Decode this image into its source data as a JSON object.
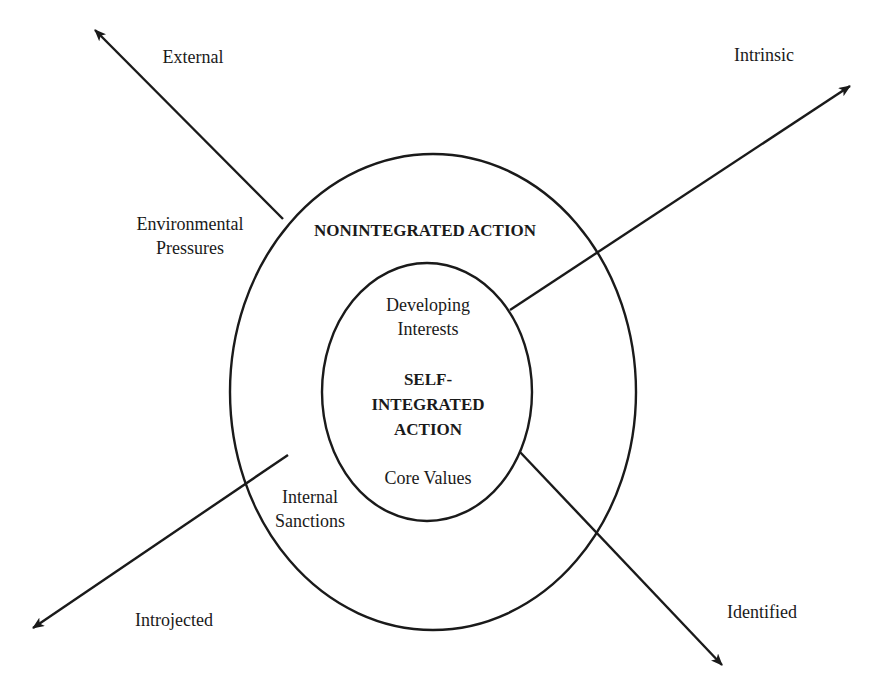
{
  "diagram": {
    "type": "concentric-ellipses-with-directional-arrows",
    "colors": {
      "stroke": "#1a1a1a",
      "background": "#ffffff",
      "text": "#1a1a1a"
    },
    "outer_region": {
      "title": "NONINTEGRATED ACTION"
    },
    "inner_region": {
      "title_line1": "SELF-",
      "title_line2": "INTEGRATED",
      "title_line3": "ACTION",
      "upper_label_line1": "Developing",
      "upper_label_line2": "Interests",
      "lower_label": "Core Values"
    },
    "outer_labels": {
      "environmental_line1": "Environmental",
      "environmental_line2": "Pressures",
      "internal_line1": "Internal",
      "internal_line2": "Sanctions"
    },
    "arrows": [
      {
        "label": "External",
        "direction": "up-left"
      },
      {
        "label": "Intrinsic",
        "direction": "up-right"
      },
      {
        "label": "Introjected",
        "direction": "down-left"
      },
      {
        "label": "Identified",
        "direction": "down-right"
      }
    ]
  }
}
